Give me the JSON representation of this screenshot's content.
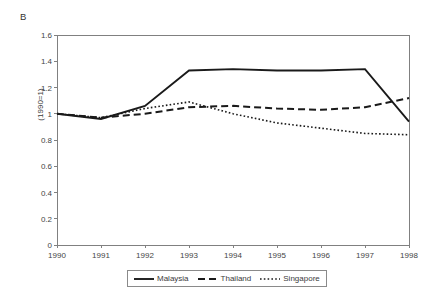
{
  "panel": {
    "label": "B"
  },
  "axes": {
    "y_title": "(1990=1)",
    "y_ticks": [
      "0",
      "0.2",
      "0.4",
      "0.6",
      "0.8",
      "1",
      "1.2",
      "1.4",
      "1.6"
    ],
    "x_ticks": [
      "1990",
      "1991",
      "1992",
      "1993",
      "1994",
      "1995",
      "1996",
      "1997",
      "1998"
    ]
  },
  "legend": {
    "entries": [
      {
        "label": "Malaysia",
        "style": "solid"
      },
      {
        "label": "Thailand",
        "style": "dashed"
      },
      {
        "label": "Singapore",
        "style": "dotted"
      }
    ]
  },
  "colors": {
    "line": "#1a1a1a",
    "axis": "#808080",
    "text": "#3b3b3b",
    "background": "#ffffff"
  },
  "chart_data": {
    "type": "line",
    "title": "B",
    "xlabel": "",
    "ylabel": "(1990=1)",
    "x": [
      1990,
      1991,
      1992,
      1993,
      1994,
      1995,
      1996,
      1997,
      1998
    ],
    "categories": [
      "1990",
      "1991",
      "1992",
      "1993",
      "1994",
      "1995",
      "1996",
      "1997",
      "1998"
    ],
    "ylim": [
      0,
      1.6
    ],
    "ytick_step": 0.2,
    "grid": false,
    "legend_position": "bottom-center",
    "series": [
      {
        "name": "Malaysia",
        "style": "solid",
        "values": [
          1.0,
          0.96,
          1.06,
          1.33,
          1.34,
          1.33,
          1.33,
          1.34,
          0.94
        ]
      },
      {
        "name": "Thailand",
        "style": "dashed",
        "values": [
          1.0,
          0.97,
          1.0,
          1.05,
          1.06,
          1.04,
          1.03,
          1.05,
          1.12
        ]
      },
      {
        "name": "Singapore",
        "style": "dotted",
        "values": [
          1.0,
          0.97,
          1.04,
          1.09,
          1.0,
          0.93,
          0.89,
          0.85,
          0.84
        ]
      }
    ]
  },
  "plot_geometry": {
    "left": 57,
    "right": 409,
    "top": 35,
    "bottom": 245
  }
}
